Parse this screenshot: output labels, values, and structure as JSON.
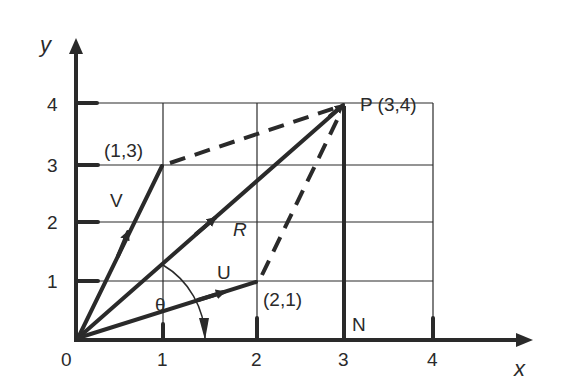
{
  "axes": {
    "x_label": "x",
    "y_label": "y",
    "origin_label": "0",
    "x_ticks": [
      "1",
      "2",
      "3",
      "4"
    ],
    "y_ticks": [
      "1",
      "2",
      "3",
      "4"
    ]
  },
  "points": {
    "p_label": "P (3,4)",
    "v_tip_label": "(1,3)",
    "u_tip_label": "(2,1)",
    "n_label": "N"
  },
  "vectors": {
    "v_label": "V",
    "r_label": "R",
    "u_label": "U",
    "angle_label": "θ"
  },
  "colors": {
    "ink": "#2a2a2a",
    "background": "#ffffff"
  }
}
